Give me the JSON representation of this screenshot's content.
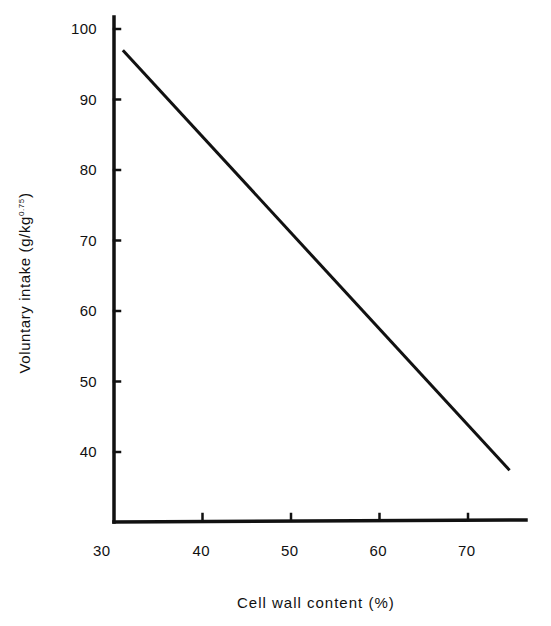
{
  "chart_data": {
    "type": "line",
    "title": "",
    "xlabel": "Cell wall content (%)",
    "ylabel": "Voluntary intake (g/kg",
    "ylabel_superscript": "0.75",
    "ylabel_close": ")",
    "x_ticks": [
      30,
      40,
      50,
      60,
      70
    ],
    "y_ticks": [
      40,
      50,
      60,
      70,
      80,
      90,
      100
    ],
    "xlim": [
      30,
      76
    ],
    "ylim": [
      31,
      102
    ],
    "grid": false,
    "legend": null,
    "series": [
      {
        "name": "Voluntary intake",
        "x": [
          31,
          74.7
        ],
        "y": [
          97,
          37.4
        ]
      }
    ]
  }
}
